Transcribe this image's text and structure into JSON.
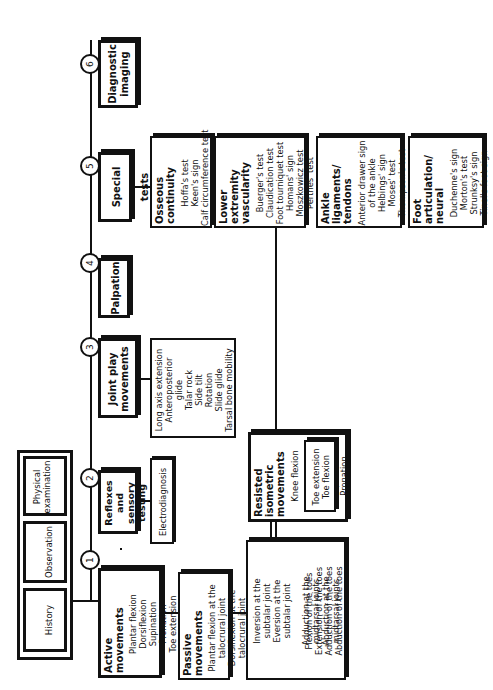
{
  "intake": {
    "history": "History",
    "observation": "Observation",
    "physical_examination": "Physical examination"
  },
  "steps": [
    {
      "number": "1",
      "title": "Active movements",
      "items": [
        "Plantar flexion",
        "Dorsiflexion",
        "Supination",
        "Pronation",
        "Toe extension",
        "Toe flexion"
      ]
    },
    {
      "number": "2",
      "title": "Reflexes and sensory testing",
      "sub": "Electrodiagnosis"
    },
    {
      "number": "3",
      "title": "Joint play movements",
      "items": [
        "Long axis extension",
        "Anteroposterior",
        "glide",
        "Talar rock",
        "Side tilt",
        "Rotation",
        "Slide glide",
        "Tarsal bone mobility"
      ]
    },
    {
      "number": "4",
      "title": "Palpation"
    },
    {
      "number": "5",
      "title": "Special tests"
    },
    {
      "number": "6",
      "title": "Diagnostic imaging"
    }
  ],
  "passive": {
    "title": "Passive movements",
    "items": [
      "Plantar flexion at the",
      "talocrural joint",
      "Dorsiflexion at the",
      "talocrural joint"
    ],
    "group2": [
      "Inversion at the",
      "subtalar joint",
      "Eversion at the",
      "subtalar joint"
    ],
    "group3": [
      "Adduction at the",
      "midtarsal joints",
      "Abduction at the",
      "midtarsal joints"
    ],
    "group4": [
      "Flexion of the toes",
      "Extension of the toes",
      "Adduction of the toes",
      "Abduction of the toes"
    ]
  },
  "resisted": {
    "title": "Resisted isometric movements",
    "items1": [
      "Knee flexion"
    ],
    "items2": [
      "Plantar flexion",
      "Dorsiflexion",
      "Supination",
      "Pronation"
    ],
    "items3": [
      "Toe extension",
      "Toe flexion"
    ]
  },
  "special_tests": [
    {
      "title": "Osseous continuity",
      "items": [
        "Hoffa's test",
        "Keen's sign",
        "Calf circumference test"
      ]
    },
    {
      "title": "Lower extremity vascularity",
      "items": [
        "Buerger's test",
        "Claudication test",
        "Foot tourniquet test",
        "Homans' sign",
        "Moszkowicz test",
        "Perthes' test"
      ]
    },
    {
      "title": "Ankle ligaments/ tendons",
      "items": [
        "Anterior drawer sign",
        "of the ankle",
        "Helbings' sign",
        "Moses' test",
        "Thompson's test"
      ]
    },
    {
      "title": "Foot articulation/ neural",
      "items": [
        "Duchenne's sign",
        "Morton's test",
        "Strunksy's sign",
        "Tinel's foot sign"
      ]
    }
  ]
}
